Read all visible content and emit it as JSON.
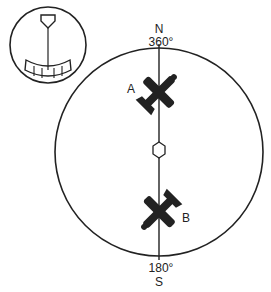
{
  "diagram": {
    "compass": {
      "north_letter": "N",
      "north_heading": "360°",
      "south_heading": "180°",
      "south_letter": "S"
    },
    "aircraft": [
      {
        "label": "A",
        "position": "north of center",
        "icon": "biplane-icon"
      },
      {
        "label": "B",
        "position": "south of center",
        "icon": "biplane-icon"
      }
    ],
    "center_marker": "hexagon-icon",
    "inset": {
      "icon": "heading-indicator-dial-icon"
    },
    "colors": {
      "ink": "#222222",
      "background": "#ffffff"
    }
  }
}
